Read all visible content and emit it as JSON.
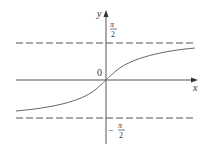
{
  "figure": {
    "type": "function-graph",
    "function": "y = arctan(x)",
    "axes": {
      "x_label": "x",
      "y_label": "y",
      "origin_label": "0"
    },
    "asymptotes": [
      {
        "label_num": "π",
        "label_den": "2",
        "sign": "",
        "value": "π/2"
      },
      {
        "label_num": "π",
        "label_den": "2",
        "sign": "−",
        "value": "-π/2"
      }
    ],
    "colors": {
      "curve": "#555555",
      "axes": "#444444",
      "asymptote": "#444444"
    }
  }
}
